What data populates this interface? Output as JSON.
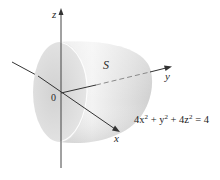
{
  "figure": {
    "type": "3d-surface-diagram",
    "surface_label": "S",
    "axes": {
      "x": "x",
      "y": "y",
      "z": "z",
      "origin": "0"
    },
    "equation": {
      "parts": [
        "4x",
        "2",
        " + y",
        "2",
        " + 4z",
        "2",
        " = 4"
      ],
      "text": "4x² + y² + 4z² = 4"
    },
    "colors": {
      "surface_light": "#f4f4f4",
      "surface_mid": "#dcdcdc",
      "surface_dark": "#c4c4c4",
      "axis": "#333333",
      "hidden_axis": "#9a9a9a"
    }
  }
}
